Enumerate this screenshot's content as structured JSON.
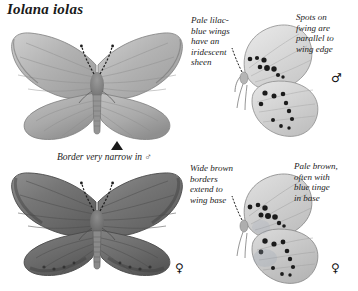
{
  "page": {
    "title": "Iolana iolas",
    "background_color": "#ffffff",
    "text_color": "#1d1d1d",
    "plate_type": "butterfly field guide plate"
  },
  "annotations": [
    {
      "id": "pale-lilac-blue",
      "text": "Pale lilac-\nblue wings\nhave an\niridescent\nsheen",
      "position": "top-center-left",
      "refers_to": "male upperside"
    },
    {
      "id": "spots-parallel",
      "text": "Spots on\nfwing are\nparallel to\nwing edge",
      "position": "top-right",
      "refers_to": "male underside"
    },
    {
      "id": "wide-brown-borders",
      "text": "Wide brown\nborders\nextend to\nwing base",
      "position": "bottom-center-left",
      "refers_to": "female upperside"
    },
    {
      "id": "pale-brown-base",
      "text": "Pale brown,\noften with\nblue tinge\nin base",
      "position": "bottom-right",
      "refers_to": "female underside"
    }
  ],
  "caption": {
    "border_narrow": "Border very narrow in ♂"
  },
  "symbols": {
    "male": "♂",
    "female": "♀"
  },
  "specimens": [
    {
      "id": "male-upperside",
      "sex": "male",
      "view": "upperside",
      "position": "top-left",
      "description": "pale lilac-blue wings with narrow dark border, spread set"
    },
    {
      "id": "male-underside",
      "sex": "male",
      "view": "underside",
      "position": "top-right",
      "description": "pale ground colour with arc of black spots on forewing and hindwing"
    },
    {
      "id": "female-upperside",
      "sex": "female",
      "view": "upperside",
      "position": "bottom-left",
      "description": "dark brown wings with wide borders extending to wing base"
    },
    {
      "id": "female-underside",
      "sex": "female",
      "view": "underside",
      "position": "bottom-right",
      "description": "pale brown ground with black spots and blue tinge at base"
    }
  ]
}
